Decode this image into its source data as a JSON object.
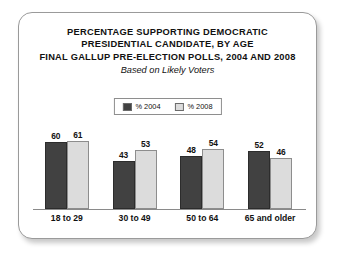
{
  "card": {
    "border_color": "#9a9a9a",
    "background": "#ffffff"
  },
  "title": {
    "line1": "PERCENTAGE SUPPORTING DEMOCRATIC",
    "line2": "PRESIDENTIAL CANDIDATE, BY AGE",
    "line3": "FINAL GALLUP PRE-ELECTION POLLS, 2004 AND 2008",
    "subtitle": "Based on Likely Voters"
  },
  "legend": {
    "entries": [
      {
        "label": "% 2004",
        "color": "#414141"
      },
      {
        "label": "% 2008",
        "color": "#dcdcdc"
      }
    ]
  },
  "chart_data": {
    "type": "bar",
    "title": "PERCENTAGE SUPPORTING DEMOCRATIC PRESIDENTIAL CANDIDATE, BY AGE FINAL GALLUP PRE-ELECTION POLLS, 2004 AND 2008",
    "subtitle": "Based on Likely Voters",
    "categories": [
      "18 to 29",
      "30 to 49",
      "50 to 64",
      "65 and older"
    ],
    "series": [
      {
        "name": "% 2004",
        "color": "#414141",
        "values": [
          60,
          43,
          48,
          52
        ]
      },
      {
        "name": "% 2008",
        "color": "#dcdcdc",
        "values": [
          61,
          53,
          54,
          46
        ]
      }
    ],
    "xlabel": "",
    "ylabel": "",
    "ylim": [
      0,
      70
    ],
    "grid": false,
    "legend_position": "top-center",
    "data_labels": true
  }
}
